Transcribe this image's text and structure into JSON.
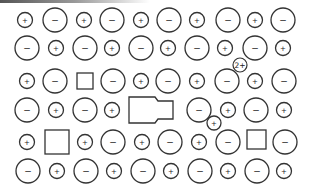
{
  "diagram": {
    "stroke_color": "#333333",
    "background": "#ffffff",
    "signs": {
      "plus": "+",
      "minus": "−",
      "two_plus": "2+"
    },
    "ions": [
      {
        "x": 25,
        "y": 20,
        "r": 7.5,
        "type": "plus"
      },
      {
        "x": 55,
        "y": 20,
        "r": 12,
        "type": "minus"
      },
      {
        "x": 84,
        "y": 20,
        "r": 7.5,
        "type": "plus"
      },
      {
        "x": 112,
        "y": 20,
        "r": 12,
        "type": "minus"
      },
      {
        "x": 141,
        "y": 20,
        "r": 7.5,
        "type": "plus"
      },
      {
        "x": 169,
        "y": 20,
        "r": 12,
        "type": "minus"
      },
      {
        "x": 197,
        "y": 20,
        "r": 7.5,
        "type": "plus"
      },
      {
        "x": 228,
        "y": 20,
        "r": 12,
        "type": "minus"
      },
      {
        "x": 255,
        "y": 20,
        "r": 7.5,
        "type": "plus"
      },
      {
        "x": 283,
        "y": 20,
        "r": 12,
        "type": "minus"
      },
      {
        "x": 27,
        "y": 48,
        "r": 12,
        "type": "minus"
      },
      {
        "x": 56,
        "y": 48,
        "r": 7.5,
        "type": "plus"
      },
      {
        "x": 85,
        "y": 48,
        "r": 12,
        "type": "minus"
      },
      {
        "x": 112,
        "y": 48,
        "r": 7.5,
        "type": "plus"
      },
      {
        "x": 141,
        "y": 48,
        "r": 12,
        "type": "minus"
      },
      {
        "x": 168,
        "y": 48,
        "r": 7.5,
        "type": "plus"
      },
      {
        "x": 197,
        "y": 48,
        "r": 12,
        "type": "minus"
      },
      {
        "x": 225,
        "y": 48,
        "r": 7.5,
        "type": "plus"
      },
      {
        "x": 255,
        "y": 48,
        "r": 12,
        "type": "minus"
      },
      {
        "x": 283,
        "y": 48,
        "r": 7.5,
        "type": "plus"
      },
      {
        "x": 27,
        "y": 81,
        "r": 7.5,
        "type": "plus"
      },
      {
        "x": 55,
        "y": 81,
        "r": 12,
        "type": "minus"
      },
      {
        "x": 113,
        "y": 81,
        "r": 12,
        "type": "minus"
      },
      {
        "x": 141,
        "y": 81,
        "r": 7.5,
        "type": "plus"
      },
      {
        "x": 168,
        "y": 81,
        "r": 12,
        "type": "minus"
      },
      {
        "x": 197,
        "y": 81,
        "r": 7.5,
        "type": "plus"
      },
      {
        "x": 227,
        "y": 81,
        "r": 12,
        "type": "minus"
      },
      {
        "x": 255,
        "y": 81,
        "r": 7.5,
        "type": "plus"
      },
      {
        "x": 284,
        "y": 81,
        "r": 12,
        "type": "minus"
      },
      {
        "x": 27,
        "y": 110,
        "r": 12,
        "type": "minus"
      },
      {
        "x": 56,
        "y": 110,
        "r": 7.5,
        "type": "plus"
      },
      {
        "x": 85,
        "y": 110,
        "r": 12,
        "type": "minus"
      },
      {
        "x": 112,
        "y": 110,
        "r": 7.5,
        "type": "plus"
      },
      {
        "x": 199,
        "y": 110,
        "r": 12,
        "type": "minus"
      },
      {
        "x": 228,
        "y": 110,
        "r": 7.5,
        "type": "plus"
      },
      {
        "x": 256,
        "y": 110,
        "r": 12,
        "type": "minus"
      },
      {
        "x": 284,
        "y": 110,
        "r": 7.5,
        "type": "plus"
      },
      {
        "x": 27,
        "y": 142,
        "r": 7.5,
        "type": "plus"
      },
      {
        "x": 85,
        "y": 142,
        "r": 7.5,
        "type": "plus"
      },
      {
        "x": 113,
        "y": 142,
        "r": 12,
        "type": "minus"
      },
      {
        "x": 142,
        "y": 142,
        "r": 7.5,
        "type": "plus"
      },
      {
        "x": 170,
        "y": 142,
        "r": 12,
        "type": "minus"
      },
      {
        "x": 199,
        "y": 142,
        "r": 7.5,
        "type": "plus"
      },
      {
        "x": 228,
        "y": 142,
        "r": 12,
        "type": "minus"
      },
      {
        "x": 285,
        "y": 142,
        "r": 12,
        "type": "minus"
      },
      {
        "x": 28,
        "y": 171,
        "r": 12,
        "type": "minus"
      },
      {
        "x": 57,
        "y": 171,
        "r": 7.5,
        "type": "plus"
      },
      {
        "x": 86,
        "y": 171,
        "r": 12,
        "type": "minus"
      },
      {
        "x": 114,
        "y": 171,
        "r": 7.5,
        "type": "plus"
      },
      {
        "x": 143,
        "y": 171,
        "r": 12,
        "type": "minus"
      },
      {
        "x": 171,
        "y": 171,
        "r": 7.5,
        "type": "plus"
      },
      {
        "x": 200,
        "y": 171,
        "r": 12,
        "type": "minus"
      },
      {
        "x": 228,
        "y": 171,
        "r": 7.5,
        "type": "plus"
      },
      {
        "x": 257,
        "y": 171,
        "r": 12,
        "type": "minus"
      },
      {
        "x": 284,
        "y": 171,
        "r": 7.5,
        "type": "plus"
      }
    ],
    "interstitials": [
      {
        "x": 240,
        "y": 65,
        "r": 7,
        "type": "two_plus",
        "label": "2+"
      },
      {
        "x": 214,
        "y": 123,
        "r": 7,
        "type": "plus"
      }
    ],
    "vacancies": [
      {
        "x": 77,
        "y": 73,
        "w": 16,
        "h": 16
      },
      {
        "x": 45,
        "y": 130,
        "w": 24,
        "h": 24
      },
      {
        "x": 247,
        "y": 130,
        "w": 19,
        "h": 19
      }
    ],
    "defect_shape": {
      "points": "129,97 155,97 158,101 173,101 173,119 158,119 155,123 129,123"
    }
  }
}
